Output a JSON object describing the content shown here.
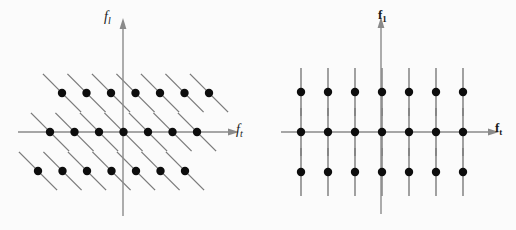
{
  "figure": {
    "background_color": "#fbfbfb",
    "line_color": "#7a7a7a",
    "axis_color": "#8a8a8a",
    "dot_color": "#0d0d0d",
    "width": 516,
    "height": 230
  },
  "panels": [
    {
      "id": "left",
      "name": "skewed-lattice-panel",
      "origin": {
        "x": 123,
        "y": 132
      },
      "axis_vertical": {
        "label_base": "f",
        "label_sub": "l",
        "style": "italic",
        "x": 123,
        "y_top": 25,
        "y_bottom": 216
      },
      "axis_horizontal": {
        "label_base": "f",
        "label_sub": "t",
        "style": "italic",
        "y": 132,
        "x_left": 18,
        "x_right": 232
      },
      "lattice": {
        "rows": 3,
        "cols": 7,
        "col_spacing": 24.5,
        "row_spacing": 39,
        "row_shift": -12,
        "dot_radius": 4.2,
        "through_line": {
          "type": "diagonal",
          "direction": "down-right",
          "angle_deg": -45,
          "half_length": 27
        },
        "dot_cols_x": [
          50,
          74.5,
          99,
          123.5,
          148,
          172.5,
          197
        ],
        "dot_rows_y": [
          93,
          132,
          171
        ]
      }
    },
    {
      "id": "right",
      "name": "rectangular-lattice-panel",
      "origin": {
        "x": 381,
        "y": 132
      },
      "axis_vertical": {
        "label_base": "f",
        "label_sub": "1",
        "style": "bold",
        "x": 381,
        "y_top": 24,
        "y_bottom": 214
      },
      "axis_horizontal": {
        "label_base": "f",
        "label_sub": "t",
        "style": "bold",
        "y": 132,
        "x_left": 281,
        "x_right": 492
      },
      "lattice": {
        "rows": 3,
        "cols": 7,
        "col_spacing": 27,
        "row_spacing": 40,
        "row_shift": 0,
        "dot_radius": 4.2,
        "through_line": {
          "type": "vertical",
          "half_length": 24
        },
        "dot_cols_x": [
          301,
          328,
          355,
          382,
          409,
          436,
          463
        ],
        "dot_rows_y": [
          92,
          132,
          172
        ]
      }
    }
  ],
  "labels": {
    "left_vertical": {
      "base": "f",
      "sub": "l"
    },
    "left_horizontal": {
      "base": "f",
      "sub": "t"
    },
    "right_vertical": {
      "base": "f",
      "sub": "1"
    },
    "right_horizontal": {
      "base": "f",
      "sub": "t"
    }
  }
}
